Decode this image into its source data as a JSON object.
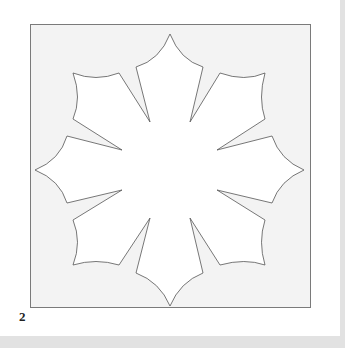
{
  "figure": {
    "label": "2",
    "frame": {
      "x": 30,
      "y": 24,
      "width": 280,
      "height": 283,
      "fill": "#f3f3f3",
      "stroke": "#7a7a7a"
    },
    "shape": {
      "description": "eight-petal star with concave scalloped edges",
      "fill": "#ffffff",
      "stroke": "#555555",
      "center": [
        170,
        170
      ]
    }
  }
}
